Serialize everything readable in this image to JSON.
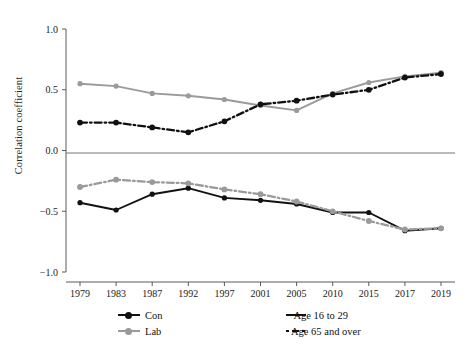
{
  "chart_data": {
    "type": "line",
    "title": "",
    "subtitle": "",
    "xlabel": "",
    "ylabel": "Correlation coefficient",
    "categories": [
      "1979",
      "1983",
      "1987",
      "1992",
      "1997",
      "2001",
      "2005",
      "2010",
      "2015",
      "2017",
      "2019"
    ],
    "x": [
      1979,
      1983,
      1987,
      1992,
      1997,
      2001,
      2005,
      2010,
      2015,
      2017,
      2019
    ],
    "ylim": [
      -1.0,
      1.0
    ],
    "yticks": [
      1.0,
      0.5,
      0.0,
      -0.5,
      -1.0
    ],
    "ytick_labels": [
      "1.0",
      "0.5",
      "0.0",
      "−0.5",
      "−1.0"
    ],
    "grid": false,
    "zero_line": true,
    "legend_position": "bottom",
    "legend_entries": [
      {
        "label": "Con",
        "kind": "colour",
        "color": "#111111"
      },
      {
        "label": "Lab",
        "kind": "colour",
        "color": "#9a9a9a"
      },
      {
        "label": "Age 16 to 29",
        "kind": "style",
        "dash": "solid"
      },
      {
        "label": "Age 65 and over",
        "kind": "style",
        "dash": "dash-dot"
      }
    ],
    "series": [
      {
        "name": "Lab, Age 16 to 29",
        "party": "Lab",
        "age_group": "Age 16 to 29",
        "color": "#9a9a9a",
        "dash": "solid",
        "values": [
          0.55,
          0.53,
          0.47,
          0.45,
          0.42,
          0.37,
          0.33,
          0.47,
          0.56,
          0.61,
          0.64
        ]
      },
      {
        "name": "Con, Age 65 and over",
        "party": "Con",
        "age_group": "Age 65 and over",
        "color": "#111111",
        "dash": "dash-dot",
        "values": [
          0.23,
          0.23,
          0.19,
          0.15,
          0.24,
          0.38,
          0.41,
          0.46,
          0.5,
          0.6,
          0.63
        ]
      },
      {
        "name": "Con, Age 16 to 29",
        "party": "Con",
        "age_group": "Age 16 to 29",
        "color": "#111111",
        "dash": "solid",
        "values": [
          -0.43,
          -0.49,
          -0.36,
          -0.31,
          -0.39,
          -0.41,
          -0.44,
          -0.51,
          -0.51,
          -0.66,
          -0.64
        ]
      },
      {
        "name": "Lab, Age 65 and over",
        "party": "Lab",
        "age_group": "Age 65 and over",
        "color": "#9a9a9a",
        "dash": "dash-dot",
        "values": [
          -0.3,
          -0.24,
          -0.26,
          -0.27,
          -0.32,
          -0.36,
          -0.42,
          -0.5,
          -0.58,
          -0.65,
          -0.64
        ]
      }
    ]
  },
  "axes": {
    "y_title": "Correlation coefficient"
  },
  "legend": {
    "con": "Con",
    "lab": "Lab",
    "age_young": "Age 16 to 29",
    "age_old": "Age 65 and over"
  }
}
